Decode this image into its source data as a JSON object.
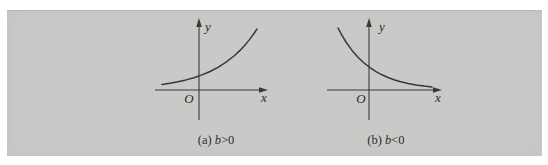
{
  "colors": {
    "page_bg": "#ffffff",
    "panel_bg": "#c9c9c7",
    "ink": "#3a3a3a",
    "text": "#2b2b2b"
  },
  "chart_data": [
    {
      "type": "line",
      "caption_index": "(a) ",
      "caption_var": "b",
      "caption_rel": ">0",
      "xlabel": "x",
      "ylabel": "y",
      "origin_label": "O",
      "title": "",
      "grid": false,
      "ticks": "none",
      "axis_numbers": "none",
      "shape": "increasing exponential curve (y = e^(bx), b > 0): flat and slightly above the x-axis at the left, crossing the y-axis at a small positive value, rising steeply toward the upper right",
      "curve_px": [
        [
          162,
          84.5
        ],
        [
          170,
          83.3
        ],
        [
          178,
          81.8
        ],
        [
          186,
          79.9
        ],
        [
          194,
          77.7
        ],
        [
          202,
          74.9
        ],
        [
          210,
          71.5
        ],
        [
          218,
          67.3
        ],
        [
          226,
          62.2
        ],
        [
          234,
          56.0
        ],
        [
          240,
          50.4
        ],
        [
          246,
          43.9
        ],
        [
          250,
          38.9
        ],
        [
          254,
          33.5
        ],
        [
          257,
          29.0
        ]
      ]
    },
    {
      "type": "line",
      "caption_index": "(b) ",
      "caption_var": "b",
      "caption_rel": "<0",
      "xlabel": "x",
      "ylabel": "y",
      "origin_label": "O",
      "title": "",
      "grid": false,
      "ticks": "none",
      "axis_numbers": "none",
      "shape": "decreasing exponential curve (y = e^(bx), b < 0): high at the upper left, falling steeply, crossing the y-axis at a positive value, flattening toward the x-axis at the right",
      "curve_px": [
        [
          338,
          28.0
        ],
        [
          342,
          35.4
        ],
        [
          346,
          42.0
        ],
        [
          352,
          50.4
        ],
        [
          358,
          57.3
        ],
        [
          364,
          63.0
        ],
        [
          370,
          67.7
        ],
        [
          376,
          71.6
        ],
        [
          382,
          74.8
        ],
        [
          388,
          77.5
        ],
        [
          394,
          79.7
        ],
        [
          400,
          81.5
        ],
        [
          408,
          83.4
        ],
        [
          416,
          84.9
        ],
        [
          424,
          86.0
        ],
        [
          432,
          86.9
        ]
      ]
    }
  ]
}
